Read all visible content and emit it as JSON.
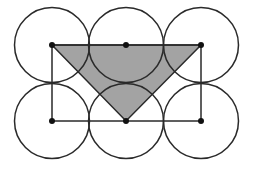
{
  "diagram": {
    "width": 254,
    "height": 171,
    "colors": {
      "background": "#ffffff",
      "stroke": "#2a2a2a",
      "shade": "#a3a3a3",
      "dot": "#111111"
    },
    "circle_radius": 37.5,
    "centers": [
      {
        "id": "top-left",
        "x": 52,
        "y": 45
      },
      {
        "id": "top-middle",
        "x": 126,
        "y": 45
      },
      {
        "id": "top-right",
        "x": 201,
        "y": 45
      },
      {
        "id": "bottom-left",
        "x": 52,
        "y": 121
      },
      {
        "id": "bottom-middle",
        "x": 126,
        "y": 121
      },
      {
        "id": "bottom-right",
        "x": 201,
        "y": 121
      }
    ],
    "rectangle": {
      "x1": 52,
      "y1": 45,
      "x2": 201,
      "y2": 121
    },
    "shaded_triangle": [
      {
        "x": 52,
        "y": 45
      },
      {
        "x": 201,
        "y": 45
      },
      {
        "x": 126,
        "y": 121
      }
    ]
  }
}
